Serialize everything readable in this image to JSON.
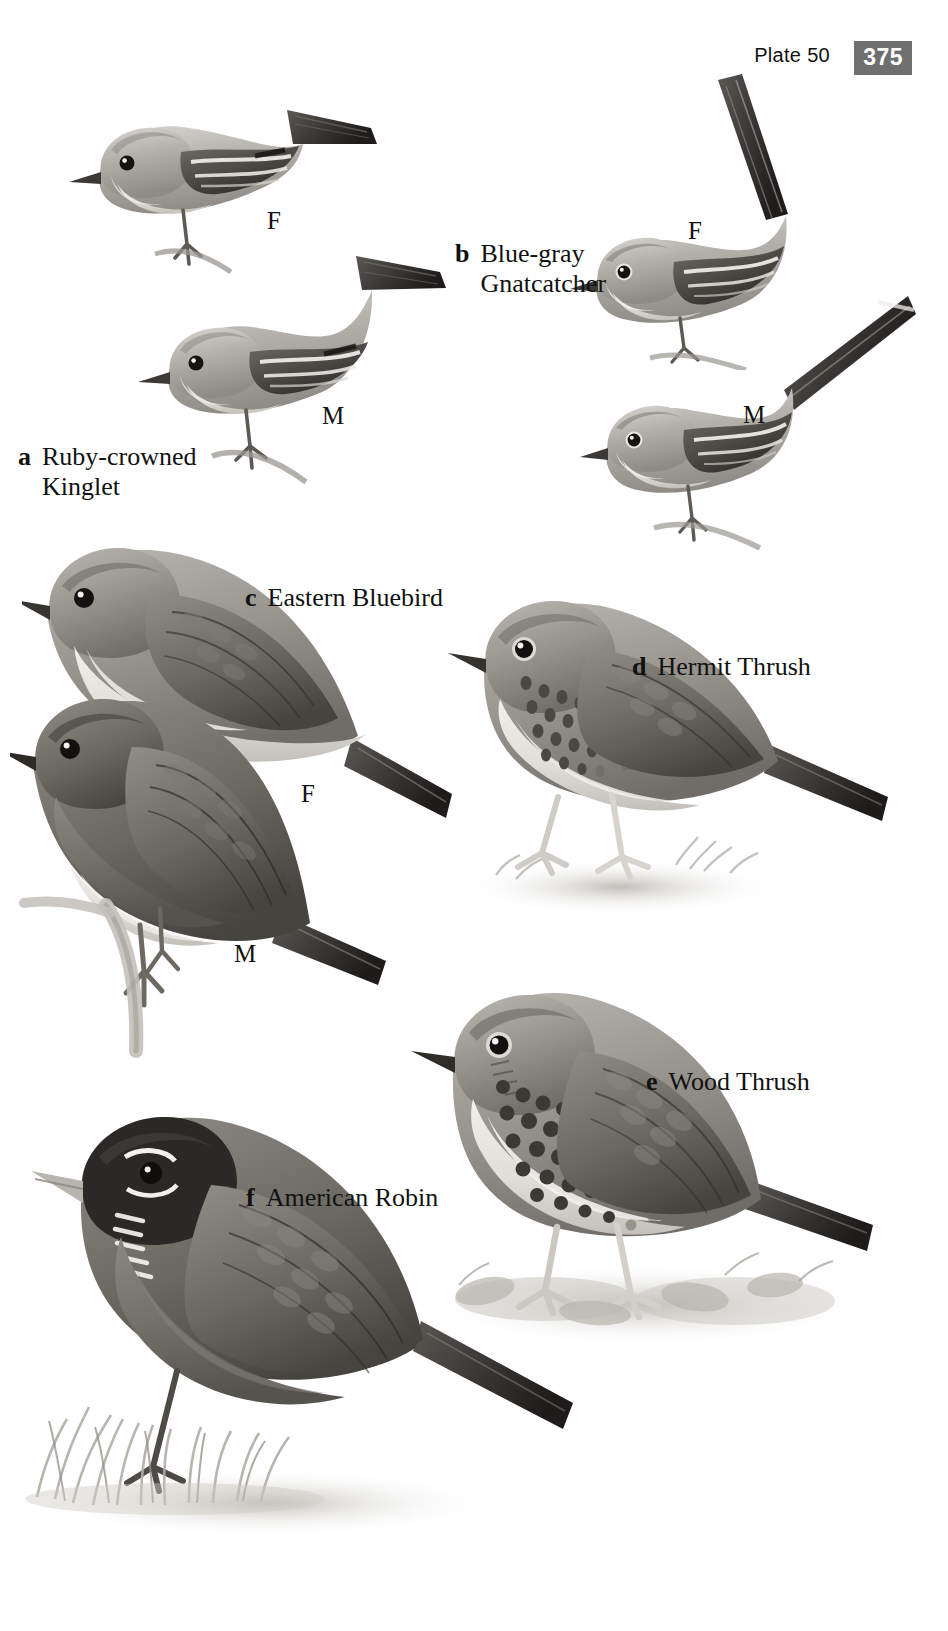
{
  "header": {
    "plate_label": "Plate 50",
    "page_number": "375",
    "badge_bg": "#6f6f6f",
    "badge_fg": "#ffffff"
  },
  "page": {
    "background": "#ffffff",
    "ink": "#111111",
    "width": 948,
    "height": 1631
  },
  "species": [
    {
      "letter": "a",
      "name": "Ruby-crowned\nKinglet",
      "name_flat": "Ruby-crowned Kinglet",
      "caption_x": 18,
      "caption_y": 411,
      "figures": [
        {
          "sex": "F",
          "x": 267,
          "y": 208
        },
        {
          "sex": "M",
          "x": 322,
          "y": 403
        }
      ]
    },
    {
      "letter": "b",
      "name": "Blue-gray\nGnatcatcher",
      "name_flat": "Blue-gray Gnatcatcher",
      "caption_x": 455,
      "caption_y": 208,
      "figures": [
        {
          "sex": "F",
          "x": 688,
          "y": 218
        },
        {
          "sex": "M",
          "x": 743,
          "y": 402
        }
      ]
    },
    {
      "letter": "c",
      "name": "Eastern Bluebird",
      "name_flat": "Eastern Bluebird",
      "caption_x": 245,
      "caption_y": 552,
      "figures": [
        {
          "sex": "F",
          "x": 301,
          "y": 781
        },
        {
          "sex": "M",
          "x": 234,
          "y": 941
        }
      ]
    },
    {
      "letter": "d",
      "name": "Hermit Thrush",
      "name_flat": "Hermit Thrush",
      "caption_x": 632,
      "caption_y": 621,
      "figures": []
    },
    {
      "letter": "e",
      "name": "Wood Thrush",
      "name_flat": "Wood Thrush",
      "caption_x": 646,
      "caption_y": 1036,
      "figures": []
    },
    {
      "letter": "f",
      "name": "American Robin",
      "name_flat": "American Robin",
      "caption_x": 246,
      "caption_y": 1152,
      "figures": []
    }
  ],
  "artwork": {
    "style": "grayscale-painted-bird-illustration",
    "figures": [
      {
        "id": "kinglet-female",
        "species_letter": "a",
        "sex": "F"
      },
      {
        "id": "kinglet-male",
        "species_letter": "a",
        "sex": "M"
      },
      {
        "id": "gnatcatcher-female",
        "species_letter": "b",
        "sex": "F"
      },
      {
        "id": "gnatcatcher-male",
        "species_letter": "b",
        "sex": "M"
      },
      {
        "id": "bluebird-female",
        "species_letter": "c",
        "sex": "F"
      },
      {
        "id": "bluebird-male",
        "species_letter": "c",
        "sex": "M"
      },
      {
        "id": "hermit-thrush",
        "species_letter": "d",
        "sex": ""
      },
      {
        "id": "wood-thrush",
        "species_letter": "e",
        "sex": ""
      },
      {
        "id": "american-robin",
        "species_letter": "f",
        "sex": ""
      }
    ]
  }
}
